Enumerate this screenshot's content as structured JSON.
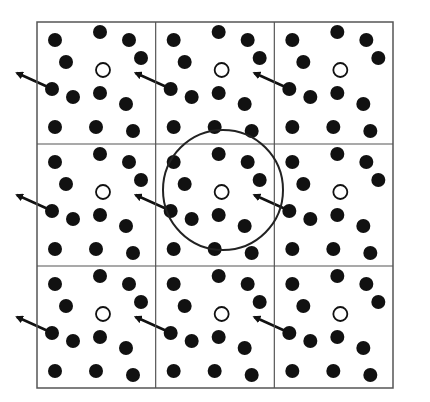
{
  "diagram": {
    "grid": {
      "left": 37,
      "top": 22,
      "right": 393,
      "bottom": 388,
      "cols": 3,
      "rows": 3,
      "line_color": "#555555"
    },
    "cell_size": {
      "width": 118.67,
      "height": 122
    },
    "particles": [
      {
        "x": 18,
        "y": 18
      },
      {
        "x": 63,
        "y": 10
      },
      {
        "x": 92,
        "y": 18
      },
      {
        "x": 29,
        "y": 40
      },
      {
        "x": 104,
        "y": 36
      },
      {
        "x": 15,
        "y": 67
      },
      {
        "x": 36,
        "y": 75
      },
      {
        "x": 63,
        "y": 71
      },
      {
        "x": 89,
        "y": 82
      },
      {
        "x": 18,
        "y": 105
      },
      {
        "x": 59,
        "y": 105
      },
      {
        "x": 96,
        "y": 109
      }
    ],
    "particle_radius": 7,
    "particle_color": "#111111",
    "reference_particle": {
      "x": 66,
      "y": 48,
      "r": 7,
      "fill": "#ffffff",
      "stroke": "#111111"
    },
    "moving_particle_index": 5,
    "arrow": {
      "dx": -35,
      "dy": -16,
      "color": "#111111"
    },
    "cutoff_circle": {
      "cx": 223,
      "cy": 190,
      "r": 60,
      "color": "#222222"
    }
  }
}
